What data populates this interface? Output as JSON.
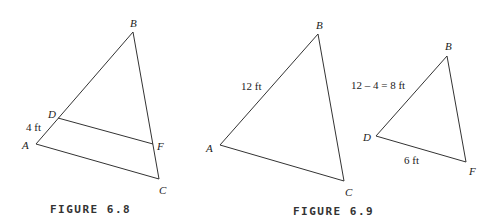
{
  "figures": [
    {
      "caption": "FIGURE 6.8",
      "vertices": {
        "A": "A",
        "B": "B",
        "C": "C",
        "D": "D",
        "F": "F"
      },
      "measurements": {
        "AD": "4 ft"
      }
    },
    {
      "caption": "FIGURE 6.9",
      "large_triangle": {
        "vertices": {
          "A": "A",
          "B": "B",
          "C": "C"
        },
        "measurements": {
          "AB": "12 ft"
        }
      },
      "small_triangle": {
        "vertices": {
          "D": "D",
          "B": "B",
          "F": "F"
        },
        "measurements": {
          "DB": "12 – 4 = 8 ft",
          "DF": "6 ft"
        }
      }
    }
  ]
}
